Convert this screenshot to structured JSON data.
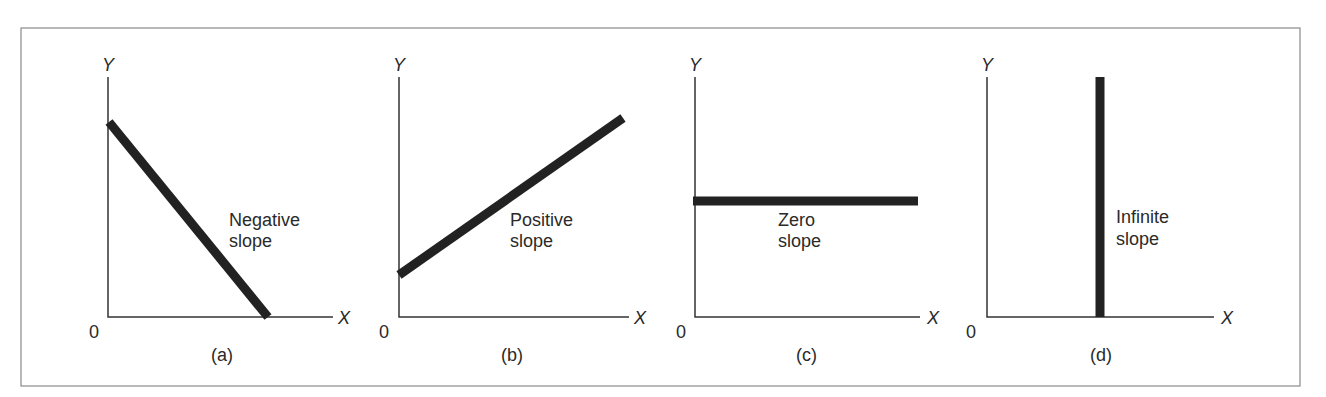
{
  "figure": {
    "frame_color": "#8a8a8a",
    "line_color": "#222222",
    "panels": [
      {
        "id": "a",
        "caption": "(a)",
        "label_line1": "Negative",
        "label_line2": "slope",
        "y_axis": "Y",
        "x_axis": "X",
        "origin": "0"
      },
      {
        "id": "b",
        "caption": "(b)",
        "label_line1": "Positive",
        "label_line2": "slope",
        "y_axis": "Y",
        "x_axis": "X",
        "origin": "0"
      },
      {
        "id": "c",
        "caption": "(c)",
        "label_line1": "Zero",
        "label_line2": "slope",
        "y_axis": "Y",
        "x_axis": "X",
        "origin": "0"
      },
      {
        "id": "d",
        "caption": "(d)",
        "label_line1": "Infinite",
        "label_line2": "slope",
        "y_axis": "Y",
        "x_axis": "X",
        "origin": "0"
      }
    ]
  }
}
